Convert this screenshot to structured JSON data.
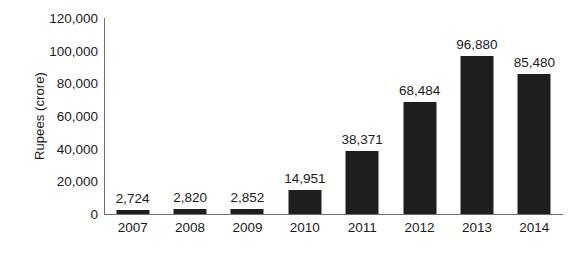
{
  "chart_data": {
    "type": "bar",
    "title": "",
    "subtitle": "",
    "xlabel": "",
    "ylabel": "Rupees (crore)",
    "categories": [
      "2007",
      "2008",
      "2009",
      "2010",
      "2011",
      "2012",
      "2013",
      "2014"
    ],
    "values": [
      2724,
      2820,
      2852,
      14951,
      38371,
      68484,
      96880,
      85480
    ],
    "value_labels": [
      "2,724",
      "2,820",
      "2,852",
      "14,951",
      "38,371",
      "68,484",
      "96,880",
      "85,480"
    ],
    "ylim": [
      0,
      120000
    ],
    "ytick_values": [
      0,
      20000,
      40000,
      60000,
      80000,
      100000,
      120000
    ],
    "ytick_labels": [
      "0",
      "20,000",
      "40,000",
      "60,000",
      "80,000",
      "100,000",
      "120,000"
    ],
    "grid": false,
    "legend": null,
    "legend_position": "none",
    "bar_color": "#1e1e1e",
    "axis_color": "#6f6f6f",
    "background_color": "#ffffff",
    "text_color": "#1a1a1a",
    "data_labels_shown": true
  }
}
